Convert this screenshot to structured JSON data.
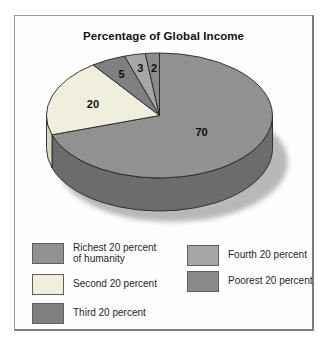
{
  "header": {
    "title": "Percentage of Global Income"
  },
  "chart_data": {
    "type": "pie",
    "style": "3d",
    "title": "Percentage of Global Income",
    "unit": "percent of global income",
    "start_angle_deg": 0,
    "direction": "clockwise",
    "slices": [
      {
        "label": "Richest 20 percent of humanity",
        "value": 70,
        "data_label": "70",
        "color": "#909292",
        "side_color": "#6a6c6d"
      },
      {
        "label": "Second 20 percent",
        "value": 20,
        "data_label": "20",
        "color": "#f0eedd",
        "side_color": "#d9d5bf"
      },
      {
        "label": "Third 20 percent",
        "value": 5,
        "data_label": "5",
        "color": "#7e8081",
        "side_color": "#636465"
      },
      {
        "label": "Fourth 20 percent",
        "value": 3,
        "data_label": "3",
        "color": "#a5a7a7",
        "side_color": "#7f8181"
      },
      {
        "label": "Poorest 20 percent",
        "value": 2,
        "data_label": "2",
        "color": "#8a8c8c",
        "side_color": "#6c6e6e"
      }
    ],
    "legend_position": "bottom",
    "shadow_color": "#b7b9b9",
    "outline_color": "#262626"
  },
  "legend": {
    "items": [
      {
        "lines": [
          "Richest 20 percent",
          "of humanity"
        ],
        "color": "#909292"
      },
      {
        "lines": [
          "Second 20 percent"
        ],
        "color": "#f0eedd"
      },
      {
        "lines": [
          "Third 20 percent"
        ],
        "color": "#7e8081"
      },
      {
        "lines": [
          "Fourth 20 percent"
        ],
        "color": "#a5a7a7"
      },
      {
        "lines": [
          "Poorest 20 percent"
        ],
        "color": "#8a8c8c"
      }
    ]
  }
}
